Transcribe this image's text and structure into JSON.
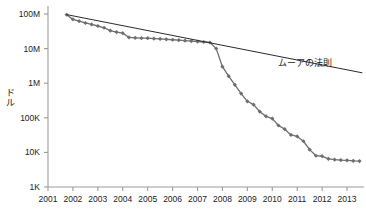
{
  "chart_data": {
    "type": "line",
    "title": "",
    "subtitle": "",
    "xlabel": "",
    "ylabel": "ドル",
    "ylabel_chars": [
      "ド",
      "ル"
    ],
    "yscale": "log",
    "ylim": [
      1000,
      100000000
    ],
    "xlim": [
      2001,
      2013.6
    ],
    "grid": false,
    "legend_position": "inline-annotation",
    "y_ticks": [
      {
        "value": 100000000,
        "label": "100M"
      },
      {
        "value": 10000000,
        "label": "10M"
      },
      {
        "value": 1000000,
        "label": "1M"
      },
      {
        "value": 100000,
        "label": "100K"
      },
      {
        "value": 10000,
        "label": "10K"
      },
      {
        "value": 1000,
        "label": "1K"
      }
    ],
    "x_ticks": [
      {
        "value": 2001,
        "label": "2001"
      },
      {
        "value": 2002,
        "label": "2002"
      },
      {
        "value": 2003,
        "label": "2003"
      },
      {
        "value": 2004,
        "label": "2004"
      },
      {
        "value": 2005,
        "label": "2005"
      },
      {
        "value": 2006,
        "label": "2006"
      },
      {
        "value": 2007,
        "label": "2007"
      },
      {
        "value": 2008,
        "label": "2008"
      },
      {
        "value": 2009,
        "label": "2009"
      },
      {
        "value": 2010,
        "label": "2010"
      },
      {
        "value": 2011,
        "label": "2011"
      },
      {
        "value": 2012,
        "label": "2012"
      },
      {
        "value": 2013,
        "label": "2013"
      }
    ],
    "annotations": [
      {
        "text": "ムーアの法則",
        "x": 2011.45,
        "y": 4200000
      }
    ],
    "series": [
      {
        "name": "cost-curve",
        "type": "line-with-markers",
        "color": "#6e6e6e",
        "marker": "diamond",
        "x": [
          2001.75,
          2002.0,
          2002.25,
          2002.5,
          2002.75,
          2003.0,
          2003.25,
          2003.5,
          2003.75,
          2004.0,
          2004.25,
          2004.5,
          2004.75,
          2005.0,
          2005.25,
          2005.5,
          2005.75,
          2006.0,
          2006.25,
          2006.5,
          2006.75,
          2007.0,
          2007.25,
          2007.5,
          2007.75,
          2008.0,
          2008.25,
          2008.5,
          2008.75,
          2009.0,
          2009.25,
          2009.5,
          2009.75,
          2010.0,
          2010.25,
          2010.5,
          2010.75,
          2011.0,
          2011.25,
          2011.5,
          2011.75,
          2012.0,
          2012.25,
          2012.5,
          2012.75,
          2013.0,
          2013.25,
          2013.5
        ],
        "y": [
          95000000,
          70000000,
          62000000,
          55000000,
          50000000,
          45000000,
          40000000,
          33000000,
          30000000,
          28000000,
          21000000,
          20500000,
          20000000,
          20000000,
          19500000,
          19000000,
          18500000,
          18000000,
          17500000,
          17000000,
          16500000,
          16000000,
          15500000,
          15000000,
          10000000,
          3000000,
          1600000,
          900000,
          500000,
          300000,
          240000,
          150000,
          110000,
          95000,
          60000,
          47000,
          32000,
          29000,
          21000,
          12000,
          8000,
          7800,
          6500,
          6200,
          6000,
          5900,
          5700,
          5600
        ]
      },
      {
        "name": "moores-law-line",
        "type": "line",
        "color": "#2a2a2a",
        "marker": "none",
        "x": [
          2001.75,
          2013.6
        ],
        "y": [
          96000000,
          2000000
        ]
      }
    ]
  }
}
